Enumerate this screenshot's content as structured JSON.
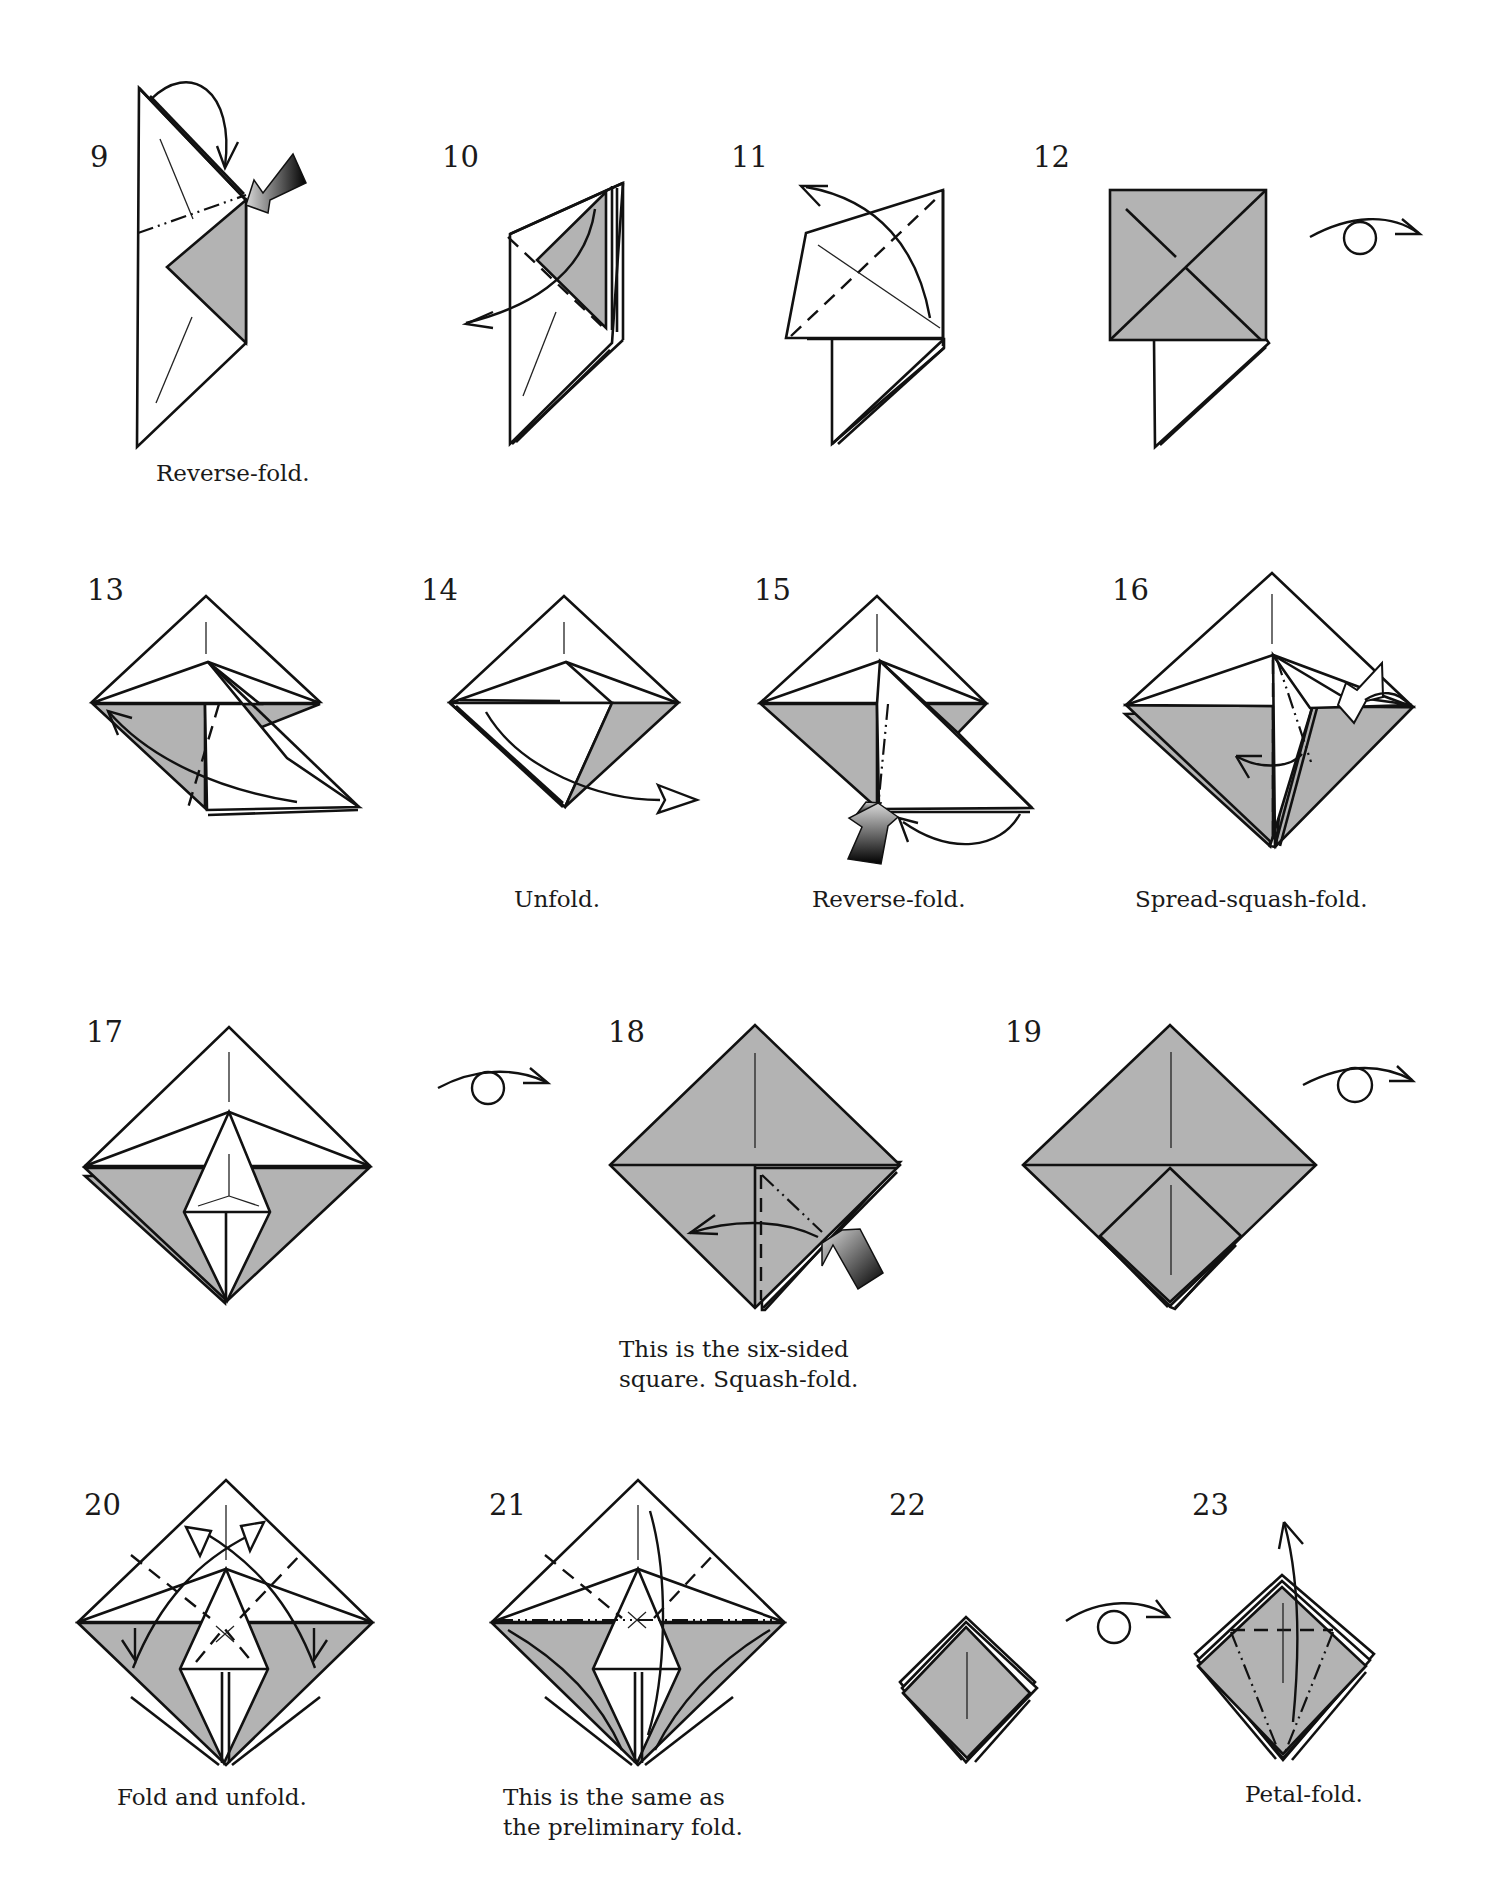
{
  "page": {
    "colors": {
      "paper_white": "#ffffff",
      "paper_colored": "#b3b3b3",
      "line": "#111111"
    }
  },
  "steps": [
    {
      "number": "9",
      "caption": "Reverse-fold.",
      "symbols": [
        "mountain-fold-line",
        "push-arrow",
        "fold-arrow"
      ]
    },
    {
      "number": "10",
      "caption": "",
      "symbols": [
        "valley-fold-line",
        "fold-arrow"
      ]
    },
    {
      "number": "11",
      "caption": "",
      "symbols": [
        "valley-fold-line",
        "fold-arrow"
      ]
    },
    {
      "number": "12",
      "caption": "",
      "symbols": [
        "turn-over-arrow"
      ]
    },
    {
      "number": "13",
      "caption": "",
      "symbols": [
        "valley-fold-line",
        "fold-arrow"
      ]
    },
    {
      "number": "14",
      "caption": "Unfold.",
      "symbols": [
        "unfold-arrow"
      ]
    },
    {
      "number": "15",
      "caption": "Reverse-fold.",
      "symbols": [
        "mountain-fold-line",
        "push-arrow",
        "fold-arrow"
      ]
    },
    {
      "number": "16",
      "caption": "Spread-squash-fold.",
      "symbols": [
        "valley-fold-line",
        "mountain-fold-line",
        "push-arrow",
        "fold-arrow"
      ]
    },
    {
      "number": "17",
      "caption": "",
      "symbols": [
        "turn-over-arrow"
      ]
    },
    {
      "number": "18",
      "caption_lines": [
        "This is the six-sided",
        "square. Squash-fold."
      ],
      "symbols": [
        "valley-fold-line",
        "mountain-fold-line",
        "push-arrow",
        "fold-arrow"
      ]
    },
    {
      "number": "19",
      "caption": "",
      "symbols": [
        "turn-over-arrow"
      ]
    },
    {
      "number": "20",
      "caption": "Fold and unfold.",
      "symbols": [
        "valley-fold-line",
        "unfold-arrow"
      ]
    },
    {
      "number": "21",
      "caption_lines": [
        "This is the same as",
        "the preliminary fold."
      ],
      "symbols": [
        "valley-fold-line",
        "mountain-fold-line",
        "fold-arrow"
      ]
    },
    {
      "number": "22",
      "caption": "",
      "symbols": [
        "turn-over-arrow"
      ]
    },
    {
      "number": "23",
      "caption": "Petal-fold.",
      "symbols": [
        "valley-fold-line",
        "mountain-fold-line",
        "fold-arrow"
      ]
    }
  ]
}
